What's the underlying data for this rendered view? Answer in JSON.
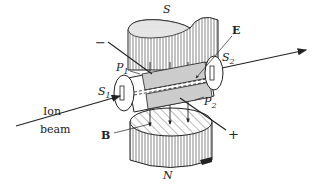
{
  "diagram": {
    "labels": {
      "south_pole": "S",
      "north_pole": "N",
      "electric_field": "E",
      "magnetic_field": "B",
      "plate1": "P",
      "plate1_sub": "1",
      "plate2": "P",
      "plate2_sub": "2",
      "slit1": "S",
      "slit1_sub": "1",
      "slit2": "S",
      "slit2_sub": "2",
      "negative_terminal": "−",
      "positive_terminal": "+",
      "ion_beam_line1": "Ion",
      "ion_beam_line2": "beam"
    },
    "colors": {
      "ink": "#222222",
      "hatch": "#555555",
      "background": "#ffffff"
    }
  }
}
